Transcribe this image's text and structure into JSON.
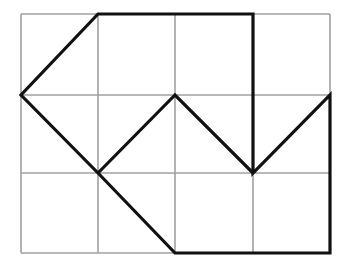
{
  "diagram": {
    "type": "grid-polygon",
    "grid": {
      "cols": 4,
      "rows": 3,
      "x_lines": [
        21,
        98,
        175,
        253,
        330
      ],
      "y_lines": [
        14,
        95,
        173,
        253
      ],
      "line_color": "#a0a0a0",
      "line_width": 1.6
    },
    "shape": {
      "stroke_color": "#111111",
      "stroke_width": 3.2,
      "vertices_grid": [
        [
          1,
          0
        ],
        [
          3,
          0
        ],
        [
          3,
          2
        ],
        [
          4,
          1
        ],
        [
          4,
          3
        ],
        [
          2,
          3
        ],
        [
          1,
          2
        ],
        [
          0,
          1
        ]
      ],
      "inner_path_grid": [
        [
          0,
          1
        ],
        [
          1,
          0
        ]
      ],
      "zigzag_grid": [
        [
          1,
          2
        ],
        [
          2,
          1
        ],
        [
          3,
          2
        ]
      ]
    }
  }
}
